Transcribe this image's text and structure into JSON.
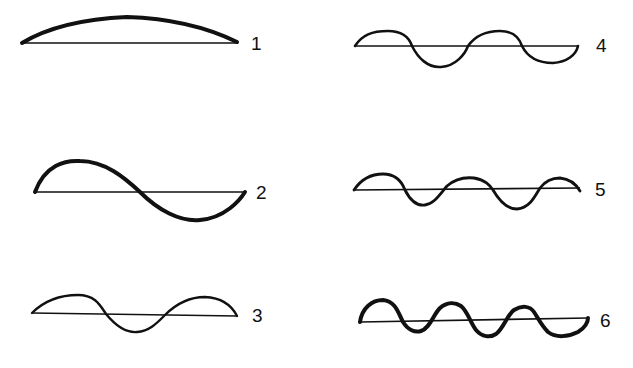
{
  "diagram": {
    "type": "standing-wave-harmonics",
    "colors": {
      "ink": "#111111",
      "background": "#ffffff"
    },
    "harmonics": [
      {
        "id": 1,
        "label": "1",
        "half_waves": 1,
        "column": "left",
        "row": 1
      },
      {
        "id": 2,
        "label": "2",
        "half_waves": 2,
        "column": "left",
        "row": 2
      },
      {
        "id": 3,
        "label": "3",
        "half_waves": 3,
        "column": "left",
        "row": 3
      },
      {
        "id": 4,
        "label": "4",
        "half_waves": 4,
        "column": "right",
        "row": 1
      },
      {
        "id": 5,
        "label": "5",
        "half_waves": 5,
        "column": "right",
        "row": 2
      },
      {
        "id": 6,
        "label": "6",
        "half_waves": 6,
        "column": "right",
        "row": 3
      }
    ]
  }
}
